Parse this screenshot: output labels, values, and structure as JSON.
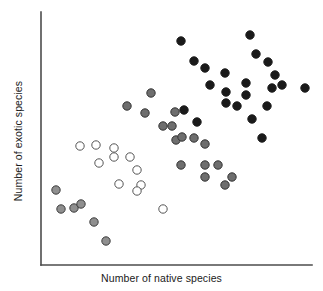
{
  "chart_data": {
    "type": "scatter",
    "title": "",
    "xlabel": "Number of native species",
    "ylabel": "Number of exotic species",
    "xlim": [
      0,
      100
    ],
    "ylim": [
      0,
      100
    ],
    "grid": false,
    "legend": "none",
    "axes": {
      "x_axis_from": [
        41,
        265
      ],
      "x_axis_to": [
        312,
        265
      ],
      "y_axis_from": [
        41,
        265
      ],
      "y_axis_to": [
        41,
        12
      ],
      "axis_color": "#4d4d4d",
      "axis_width": 1.6,
      "ticks": "none"
    },
    "marker": {
      "radius": 4.2,
      "stroke_width": 1.0
    },
    "series": [
      {
        "name": "open",
        "fill": "#ffffff",
        "stroke": "#555555",
        "points": [
          [
            80,
            146
          ],
          [
            96,
            145
          ],
          [
            114,
            148
          ],
          [
            114,
            157
          ],
          [
            99,
            163
          ],
          [
            130,
            157
          ],
          [
            137,
            170
          ],
          [
            119,
            184
          ],
          [
            141,
            185
          ],
          [
            137,
            191
          ],
          [
            163,
            209
          ]
        ]
      },
      {
        "name": "light-gray",
        "fill": "#8f8f8f",
        "stroke": "#3d3d3d",
        "points": [
          [
            56,
            190
          ],
          [
            61,
            209
          ],
          [
            74,
            208
          ],
          [
            81,
            204
          ],
          [
            94,
            222
          ],
          [
            106,
            241
          ]
        ]
      },
      {
        "name": "medium-gray",
        "fill": "#6e6e6e",
        "stroke": "#333333",
        "points": [
          [
            151,
            93
          ],
          [
            127,
            106
          ],
          [
            145,
            113
          ],
          [
            175,
            112
          ],
          [
            163,
            126
          ],
          [
            172,
            126
          ],
          [
            176,
            140
          ],
          [
            182,
            137
          ],
          [
            194,
            138
          ],
          [
            205,
            144
          ],
          [
            181,
            165
          ],
          [
            205,
            165
          ],
          [
            218,
            165
          ],
          [
            205,
            177
          ],
          [
            225,
            185
          ],
          [
            232,
            177
          ]
        ]
      },
      {
        "name": "black",
        "fill": "#1a1a1a",
        "stroke": "#1a1a1a",
        "points": [
          [
            181,
            41
          ],
          [
            250,
            35
          ],
          [
            194,
            61
          ],
          [
            205,
            68
          ],
          [
            256,
            54
          ],
          [
            225,
            73
          ],
          [
            268,
            62
          ],
          [
            275,
            75
          ],
          [
            246,
            83
          ],
          [
            210,
            85
          ],
          [
            226,
            92
          ],
          [
            282,
            85
          ],
          [
            272,
            88
          ],
          [
            305,
            88
          ],
          [
            246,
            95
          ],
          [
            226,
            103
          ],
          [
            237,
            106
          ],
          [
            267,
            106
          ],
          [
            252,
            119
          ],
          [
            262,
            138
          ],
          [
            184,
            110
          ],
          [
            197,
            122
          ]
        ]
      }
    ]
  }
}
